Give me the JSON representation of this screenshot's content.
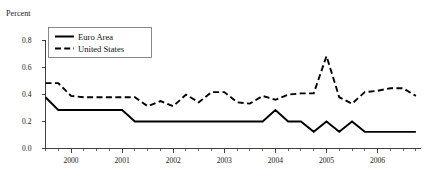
{
  "chart_data": {
    "type": "line",
    "title": "",
    "subtitle": "",
    "ylabel": "Percent",
    "xlabel": "",
    "ylim": [
      0.0,
      0.85
    ],
    "xlim": [
      1999.5,
      2006.85
    ],
    "grid": false,
    "legend_position": "top-left",
    "y_ticks": [
      {
        "value": 0.0,
        "label": "0.0"
      },
      {
        "value": 0.2,
        "label": "0.2"
      },
      {
        "value": 0.4,
        "label": "0.4"
      },
      {
        "value": 0.6,
        "label": "0.6"
      },
      {
        "value": 0.8,
        "label": "0.8"
      }
    ],
    "x_ticks": [
      {
        "value": 2000,
        "label": "2000"
      },
      {
        "value": 2001,
        "label": "2001"
      },
      {
        "value": 2002,
        "label": "2002"
      },
      {
        "value": 2003,
        "label": "2003"
      },
      {
        "value": 2004,
        "label": "2004"
      },
      {
        "value": 2005,
        "label": "2005"
      },
      {
        "value": 2006,
        "label": "2006"
      }
    ],
    "x_minor_tick_step": 0.25,
    "series": [
      {
        "name": "Euro Area",
        "style": "solid",
        "color": "#000000",
        "x": [
          1999.5,
          1999.75,
          2000.0,
          2000.25,
          2000.5,
          2000.75,
          2001.0,
          2001.25,
          2001.5,
          2001.75,
          2002.0,
          2002.25,
          2002.5,
          2002.75,
          2003.0,
          2003.25,
          2003.5,
          2003.75,
          2004.0,
          2004.25,
          2004.5,
          2004.75,
          2005.0,
          2005.25,
          2005.5,
          2005.75,
          2006.0,
          2006.25,
          2006.5,
          2006.75
        ],
        "values": [
          0.4,
          0.3,
          0.3,
          0.3,
          0.3,
          0.3,
          0.3,
          0.21,
          0.21,
          0.21,
          0.21,
          0.21,
          0.21,
          0.21,
          0.21,
          0.21,
          0.21,
          0.21,
          0.3,
          0.21,
          0.21,
          0.13,
          0.21,
          0.13,
          0.21,
          0.13,
          0.13,
          0.13,
          0.13,
          0.13
        ]
      },
      {
        "name": "United States",
        "style": "dashed",
        "color": "#000000",
        "x": [
          1999.5,
          1999.75,
          2000.0,
          2000.25,
          2000.5,
          2000.75,
          2001.0,
          2001.25,
          2001.5,
          2001.75,
          2002.0,
          2002.25,
          2002.5,
          2002.75,
          2003.0,
          2003.25,
          2003.5,
          2003.75,
          2004.0,
          2004.25,
          2004.5,
          2004.75,
          2005.0,
          2005.25,
          2005.5,
          2005.75,
          2006.0,
          2006.25,
          2006.5,
          2006.75
        ],
        "values": [
          0.51,
          0.51,
          0.41,
          0.4,
          0.4,
          0.4,
          0.4,
          0.4,
          0.33,
          0.37,
          0.33,
          0.42,
          0.36,
          0.44,
          0.44,
          0.36,
          0.35,
          0.41,
          0.38,
          0.42,
          0.43,
          0.43,
          0.72,
          0.4,
          0.35,
          0.44,
          0.45,
          0.47,
          0.47,
          0.41
        ]
      }
    ],
    "legend": [
      {
        "label": "Euro Area",
        "style": "solid"
      },
      {
        "label": "United States",
        "style": "dashed"
      }
    ]
  }
}
